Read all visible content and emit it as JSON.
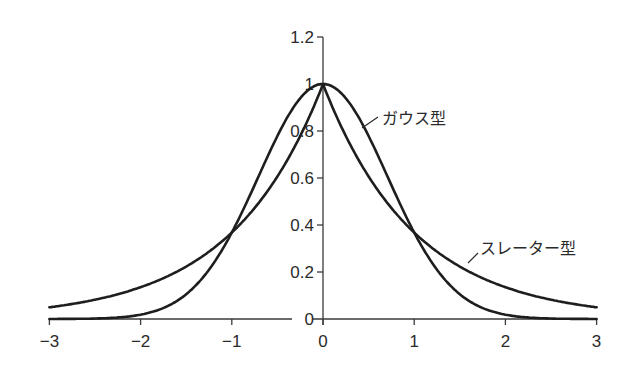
{
  "chart_data": {
    "type": "line",
    "title": "",
    "xlabel": "",
    "ylabel": "",
    "xlim": [
      -3,
      3
    ],
    "ylim": [
      0,
      1.2
    ],
    "grid": false,
    "legend": "inline labels",
    "x_ticks": [
      "−3",
      "−2",
      "−1",
      "0",
      "1",
      "2",
      "3"
    ],
    "y_ticks": [
      "0",
      "0.2",
      "0.4",
      "0.6",
      "0.8",
      "1",
      "1.2"
    ],
    "series": [
      {
        "name": "ガウス型",
        "function": "exp(-x^2)",
        "x": [
          -3,
          -2.5,
          -2,
          -1.5,
          -1,
          -0.5,
          0,
          0.5,
          1,
          1.5,
          2,
          2.5,
          3
        ],
        "values": [
          0.0001,
          0.002,
          0.018,
          0.105,
          0.368,
          0.779,
          1.0,
          0.779,
          0.368,
          0.105,
          0.018,
          0.002,
          0.0001
        ]
      },
      {
        "name": "スレーター型",
        "function": "exp(-|x|)",
        "x": [
          -3,
          -2.5,
          -2,
          -1.5,
          -1,
          -0.5,
          0,
          0.5,
          1,
          1.5,
          2,
          2.5,
          3
        ],
        "values": [
          0.05,
          0.082,
          0.135,
          0.223,
          0.368,
          0.607,
          1.0,
          0.607,
          0.368,
          0.223,
          0.135,
          0.082,
          0.05
        ]
      }
    ],
    "annotations": [
      {
        "text": "ガウス型",
        "points_to": "gaussian curve near x=0.3"
      },
      {
        "text": "スレーター型",
        "points_to": "slater curve near x=1.6"
      }
    ]
  },
  "labels": {
    "gaussian": "ガウス型",
    "slater": "スレーター型"
  }
}
